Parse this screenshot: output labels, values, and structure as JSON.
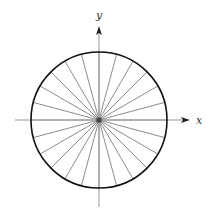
{
  "diagram": {
    "type": "circle-with-radial-spokes",
    "center": {
      "x": 99,
      "y": 120
    },
    "radius": 68,
    "spoke_angle_step_deg": 15,
    "spoke_count": 24,
    "colors": {
      "circle": "#111111",
      "spokes": "#6e6e6e",
      "axes": "#9a9a9a",
      "arrowheads": "#222222",
      "center_hub": "#444444"
    },
    "axes": {
      "x": {
        "label": "x",
        "from": 15,
        "to": 190
      },
      "y": {
        "label": "y",
        "from": 207,
        "to": 26
      }
    }
  }
}
